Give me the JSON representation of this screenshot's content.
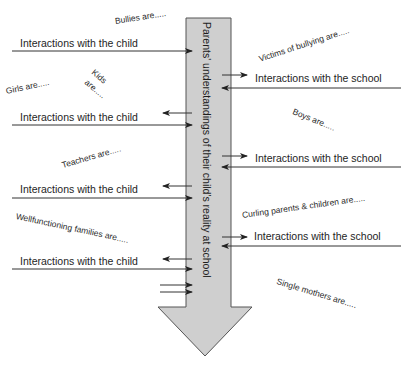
{
  "diagram": {
    "central_arrow": {
      "label": "Parents' understandings of their child's reality at school",
      "fill": "#cfcfcf",
      "stroke": "#555555"
    },
    "child_interactions": [
      {
        "label": "Interactions with the child"
      },
      {
        "label": "Interactions with the child"
      },
      {
        "label": "Interactions with the child"
      },
      {
        "label": "Interactions with the child"
      }
    ],
    "school_interactions": [
      {
        "label": "Interactions with the school"
      },
      {
        "label": "Interactions with the school"
      },
      {
        "label": "Interactions with the school"
      }
    ],
    "notes": {
      "bullies": "Bullies are.....",
      "girls": "Girls are.....",
      "kids_line1": "Kids",
      "kids_line2": "are.....",
      "teachers": "Teachers are.....",
      "wellfunctioning": "Wellfunctioning families are.....",
      "victims": "Victims of bullying are.....",
      "boys": "Boys are.....",
      "curling": "Curling parents & children are.....",
      "single_mothers": "Single mothers are....."
    },
    "colors": {
      "line": "#333333",
      "text": "#1e1e1e"
    }
  }
}
